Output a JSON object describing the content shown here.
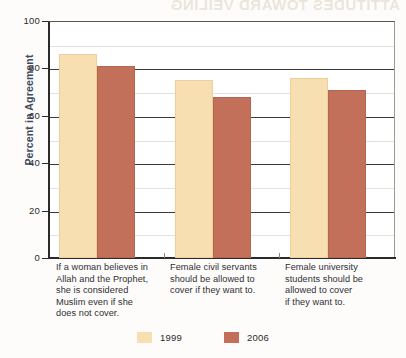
{
  "bleed_through_text": "ATTITUDES TOWARD VEILING",
  "chart_data": {
    "type": "bar",
    "title": "",
    "xlabel": "",
    "ylabel": "Percent in Agreement",
    "ylim": [
      0,
      100
    ],
    "ytick_values": [
      0,
      20,
      40,
      60,
      80,
      100
    ],
    "ytick_labels": [
      "0",
      "20",
      "40",
      "60",
      "80",
      "100"
    ],
    "minor_gridline_values": [
      10,
      30,
      50,
      70,
      90
    ],
    "grid": true,
    "legend_position": "bottom-center",
    "categories": [
      "If a woman believes in Allah and the Prophet, she is considered Muslim even if she does not cover.",
      "Female civil servants should be allowed to cover if they want to.",
      "Female university students should be allowed to cover if they want to."
    ],
    "category_label_lines": [
      [
        "If a woman believes in",
        "Allah and the Prophet,",
        "she is considered",
        "Muslim even if she",
        "does not cover."
      ],
      [
        "Female civil servants",
        "should be allowed to",
        "cover if they want to."
      ],
      [
        "Female university",
        "students should be",
        "allowed to cover",
        "if they want to."
      ]
    ],
    "series": [
      {
        "name": "1999",
        "color": "#f8dfb2",
        "values": [
          86,
          75,
          76
        ]
      },
      {
        "name": "2006",
        "color": "#c2705a",
        "values": [
          81,
          68,
          71
        ]
      }
    ]
  },
  "legend": {
    "items": [
      {
        "label": "1999",
        "color": "#f8dfb2"
      },
      {
        "label": "2006",
        "color": "#c2705a"
      }
    ]
  },
  "colors": {
    "series_1999": "#f8dfb2",
    "series_2006": "#c2705a",
    "axis": "#2b2b2b",
    "axis_title": "#3e4a63",
    "gridline_major": "#3a3a3a",
    "gridline_minor": "#e4e2dc",
    "background": "#fdfcfa"
  }
}
